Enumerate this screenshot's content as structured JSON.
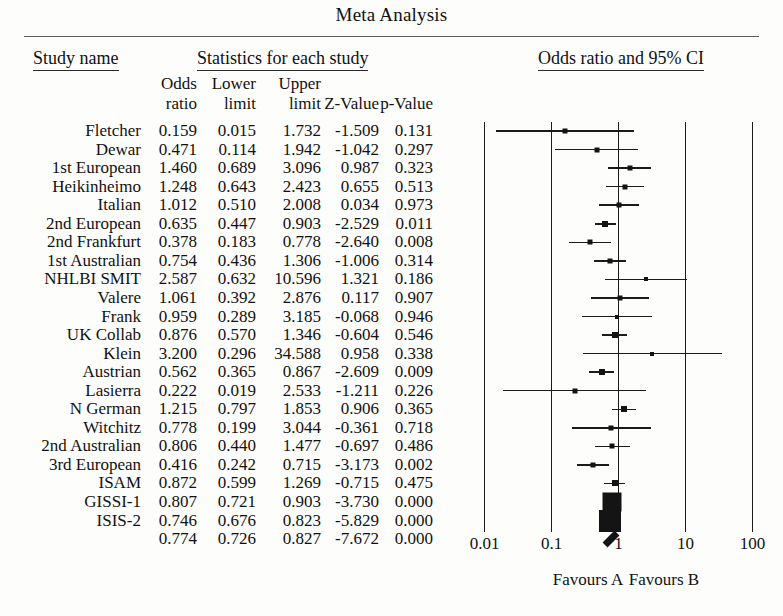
{
  "title": "Meta Analysis",
  "headers": {
    "study_group": "Study name",
    "stats_group": "Statistics for each study",
    "plot_group": "Odds ratio and 95% CI",
    "sub": {
      "odds_1": "Odds",
      "odds_2": "ratio",
      "lower_1": "Lower",
      "lower_2": "limit",
      "upper_1": "Upper",
      "upper_2": "limit",
      "z": "Z-Value",
      "p": "p-Value"
    }
  },
  "axis": {
    "ticks": [
      "0.01",
      "0.1",
      "1",
      "10",
      "100"
    ],
    "tick_values": [
      0.01,
      0.1,
      1,
      10,
      100
    ],
    "favours_left": "Favours A",
    "favours_right": "Favours B"
  },
  "chart_data": {
    "type": "forest",
    "title": "Meta Analysis",
    "xlabel": "Odds ratio and 95% CI",
    "xscale": "log",
    "xlim": [
      0.01,
      100
    ],
    "grid": true,
    "columns": [
      "Study name",
      "Odds ratio",
      "Lower limit",
      "Upper limit",
      "Z-Value",
      "p-Value"
    ],
    "rows": [
      {
        "name": "Fletcher",
        "or": "0.159",
        "lo": "0.015",
        "hi": "1.732",
        "z": "-1.509",
        "p": "0.131",
        "or_v": 0.159,
        "lo_v": 0.015,
        "hi_v": 1.732,
        "w": 5
      },
      {
        "name": "Dewar",
        "or": "0.471",
        "lo": "0.114",
        "hi": "1.942",
        "z": "-1.042",
        "p": "0.297",
        "or_v": 0.471,
        "lo_v": 0.114,
        "hi_v": 1.942,
        "w": 5
      },
      {
        "name": "1st European",
        "or": "1.460",
        "lo": "0.689",
        "hi": "3.096",
        "z": "0.987",
        "p": "0.323",
        "or_v": 1.46,
        "lo_v": 0.689,
        "hi_v": 3.096,
        "w": 5
      },
      {
        "name": "Heikinheimo",
        "or": "1.248",
        "lo": "0.643",
        "hi": "2.423",
        "z": "0.655",
        "p": "0.513",
        "or_v": 1.248,
        "lo_v": 0.643,
        "hi_v": 2.423,
        "w": 5
      },
      {
        "name": "Italian",
        "or": "1.012",
        "lo": "0.510",
        "hi": "2.008",
        "z": "0.034",
        "p": "0.973",
        "or_v": 1.012,
        "lo_v": 0.51,
        "hi_v": 2.008,
        "w": 5
      },
      {
        "name": "2nd European",
        "or": "0.635",
        "lo": "0.447",
        "hi": "0.903",
        "z": "-2.529",
        "p": "0.011",
        "or_v": 0.635,
        "lo_v": 0.447,
        "hi_v": 0.903,
        "w": 6
      },
      {
        "name": "2nd Frankfurt",
        "or": "0.378",
        "lo": "0.183",
        "hi": "0.778",
        "z": "-2.640",
        "p": "0.008",
        "or_v": 0.378,
        "lo_v": 0.183,
        "hi_v": 0.778,
        "w": 5
      },
      {
        "name": "1st Australian",
        "or": "0.754",
        "lo": "0.436",
        "hi": "1.306",
        "z": "-1.006",
        "p": "0.314",
        "or_v": 0.754,
        "lo_v": 0.436,
        "hi_v": 1.306,
        "w": 5
      },
      {
        "name": "NHLBI SMIT",
        "or": "2.587",
        "lo": "0.632",
        "hi": "10.596",
        "z": "1.321",
        "p": "0.186",
        "or_v": 2.587,
        "lo_v": 0.632,
        "hi_v": 10.596,
        "w": 4
      },
      {
        "name": "Valere",
        "or": "1.061",
        "lo": "0.392",
        "hi": "2.876",
        "z": "0.117",
        "p": "0.907",
        "or_v": 1.061,
        "lo_v": 0.392,
        "hi_v": 2.876,
        "w": 5
      },
      {
        "name": "Frank",
        "or": "0.959",
        "lo": "0.289",
        "hi": "3.185",
        "z": "-0.068",
        "p": "0.946",
        "or_v": 0.959,
        "lo_v": 0.289,
        "hi_v": 3.185,
        "w": 4
      },
      {
        "name": "UK Collab",
        "or": "0.876",
        "lo": "0.570",
        "hi": "1.346",
        "z": "-0.604",
        "p": "0.546",
        "or_v": 0.876,
        "lo_v": 0.57,
        "hi_v": 1.346,
        "w": 6
      },
      {
        "name": "Klein",
        "or": "3.200",
        "lo": "0.296",
        "hi": "34.588",
        "z": "0.958",
        "p": "0.338",
        "or_v": 3.2,
        "lo_v": 0.296,
        "hi_v": 34.588,
        "w": 4
      },
      {
        "name": "Austrian",
        "or": "0.562",
        "lo": "0.365",
        "hi": "0.867",
        "z": "-2.609",
        "p": "0.009",
        "or_v": 0.562,
        "lo_v": 0.365,
        "hi_v": 0.867,
        "w": 6
      },
      {
        "name": "Lasierra",
        "or": "0.222",
        "lo": "0.019",
        "hi": "2.533",
        "z": "-1.211",
        "p": "0.226",
        "or_v": 0.222,
        "lo_v": 0.019,
        "hi_v": 2.533,
        "w": 5
      },
      {
        "name": "N German",
        "or": "1.215",
        "lo": "0.797",
        "hi": "1.853",
        "z": "0.906",
        "p": "0.365",
        "or_v": 1.215,
        "lo_v": 0.797,
        "hi_v": 1.853,
        "w": 6
      },
      {
        "name": "Witchitz",
        "or": "0.778",
        "lo": "0.199",
        "hi": "3.044",
        "z": "-0.361",
        "p": "0.718",
        "or_v": 0.778,
        "lo_v": 0.199,
        "hi_v": 3.044,
        "w": 5
      },
      {
        "name": "2nd Australian",
        "or": "0.806",
        "lo": "0.440",
        "hi": "1.477",
        "z": "-0.697",
        "p": "0.486",
        "or_v": 0.806,
        "lo_v": 0.44,
        "hi_v": 1.477,
        "w": 5
      },
      {
        "name": "3rd European",
        "or": "0.416",
        "lo": "0.242",
        "hi": "0.715",
        "z": "-3.173",
        "p": "0.002",
        "or_v": 0.416,
        "lo_v": 0.242,
        "hi_v": 0.715,
        "w": 5
      },
      {
        "name": "ISAM",
        "or": "0.872",
        "lo": "0.599",
        "hi": "1.269",
        "z": "-0.715",
        "p": "0.475",
        "or_v": 0.872,
        "lo_v": 0.599,
        "hi_v": 1.269,
        "w": 6
      },
      {
        "name": "GISSI-1",
        "or": "0.807",
        "lo": "0.721",
        "hi": "0.903",
        "z": "-3.730",
        "p": "0.000",
        "or_v": 0.807,
        "lo_v": 0.721,
        "hi_v": 0.903,
        "w": 19
      },
      {
        "name": "ISIS-2",
        "or": "0.746",
        "lo": "0.676",
        "hi": "0.823",
        "z": "-5.829",
        "p": "0.000",
        "or_v": 0.746,
        "lo_v": 0.676,
        "hi_v": 0.823,
        "w": 22
      }
    ],
    "summary": {
      "name": "",
      "or": "0.774",
      "lo": "0.726",
      "hi": "0.827",
      "z": "-7.672",
      "p": "0.000",
      "or_v": 0.774,
      "lo_v": 0.726,
      "hi_v": 0.827
    }
  }
}
